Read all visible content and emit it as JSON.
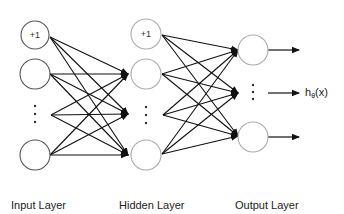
{
  "diagram": {
    "type": "feed-forward neural network",
    "layers": {
      "input": {
        "label": "Input Layer",
        "bias_label": "+1",
        "nodes": [
          {
            "id": "in-bias",
            "cx": 35,
            "cy": 35,
            "label": "+1"
          },
          {
            "id": "in-1",
            "cx": 35,
            "cy": 74,
            "label": ""
          },
          {
            "id": "in-ellipsis",
            "cx": 35,
            "cy": 115,
            "ellipsis": true
          },
          {
            "id": "in-n",
            "cx": 35,
            "cy": 155,
            "label": ""
          }
        ]
      },
      "hidden": {
        "label": "Hidden Layer",
        "bias_label": "+1",
        "nodes": [
          {
            "id": "hid-bias",
            "cx": 146,
            "cy": 35,
            "label": "+1"
          },
          {
            "id": "hid-1",
            "cx": 146,
            "cy": 74,
            "label": ""
          },
          {
            "id": "hid-ellipsis",
            "cx": 146,
            "cy": 115,
            "ellipsis": true
          },
          {
            "id": "hid-n",
            "cx": 146,
            "cy": 155,
            "label": ""
          }
        ]
      },
      "output": {
        "label": "Output Layer",
        "nodes": [
          {
            "id": "out-1",
            "cx": 253,
            "cy": 50,
            "label": ""
          },
          {
            "id": "out-ellipsis",
            "cx": 253,
            "cy": 93,
            "ellipsis": true
          },
          {
            "id": "out-n",
            "cx": 253,
            "cy": 137,
            "label": ""
          }
        ]
      }
    },
    "output_function": {
      "base": "h",
      "subscript": "θ",
      "arg": "(x)"
    },
    "colors": {
      "input_node_stroke": "#555555",
      "other_node_stroke": "#aaaaaa",
      "edge": "#111111",
      "text": "#222222"
    }
  }
}
